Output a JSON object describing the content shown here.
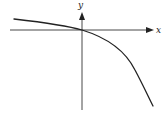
{
  "diagram": {
    "type": "function-graph",
    "axes": {
      "x_label": "x",
      "y_label": "y",
      "origin": [
        82,
        30
      ],
      "x_axis": {
        "from": [
          10,
          30
        ],
        "to": [
          153,
          30
        ]
      },
      "y_axis": {
        "from": [
          82,
          110
        ],
        "to": [
          82,
          13
        ]
      }
    },
    "curve": {
      "description": "Decreasing concave-down curve passing through the origin",
      "path": "M14,19 C40,22 65,25 82,30 C105,37 125,50 135,70 C143,85 148,96 153,106",
      "color": "#222222"
    },
    "colors": {
      "axis": "#333333",
      "curve": "#222222",
      "background": "#ffffff"
    }
  }
}
